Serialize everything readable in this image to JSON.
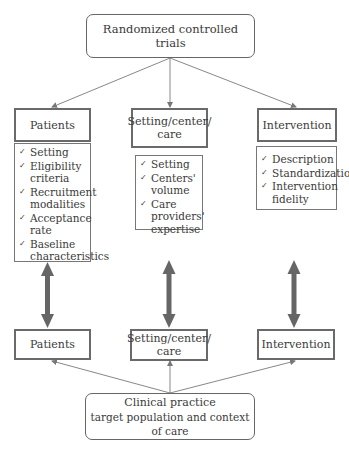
{
  "top_box": {
    "label": "Randomized controlled trials"
  },
  "bottom_box": {
    "line1": "Clinical practice",
    "line2": "target population and context of care"
  },
  "columns": [
    {
      "header": "Patients",
      "items": [
        "Setting",
        "Eligibility criteria",
        "Recruitment modalities",
        "Acceptance rate",
        "Baseline characteristics"
      ],
      "bottom_label": "Patients"
    },
    {
      "header": "Setting/center/ care",
      "items": [
        "Setting",
        "Centers' volume",
        "Care providers' expertise"
      ],
      "bottom_label": "Setting/center/ care"
    },
    {
      "header": "Intervention",
      "items": [
        "Description",
        "Standardization",
        "Intervention fidelity"
      ],
      "bottom_label": "Intervention"
    }
  ],
  "check_glyph": "✓",
  "colors": {
    "line": "#777777",
    "thick_arrow": "#666666",
    "border": "#6a6a6a"
  }
}
